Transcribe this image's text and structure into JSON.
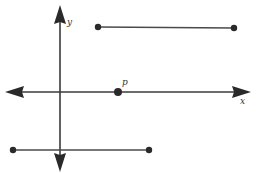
{
  "diagram": {
    "colors": {
      "stroke": "#3a3a3a",
      "point": "#2a2a2a",
      "background": "#ffffff"
    },
    "axes": {
      "x": {
        "label": "x",
        "y": 92,
        "x_start": 5,
        "x_end": 251
      },
      "y": {
        "label": "y",
        "x": 60,
        "y_start": 4,
        "y_end": 172
      }
    },
    "point_p": {
      "label": "p",
      "cx": 118,
      "cy": 92
    },
    "segments": [
      {
        "name": "top-segment",
        "x1": 98,
        "y1": 27,
        "x2": 234,
        "y2": 28
      },
      {
        "name": "bottom-segment",
        "x1": 13,
        "y1": 150,
        "x2": 149,
        "y2": 150
      }
    ],
    "labels": {
      "x_axis": "x",
      "y_axis": "y",
      "point": "p"
    }
  }
}
